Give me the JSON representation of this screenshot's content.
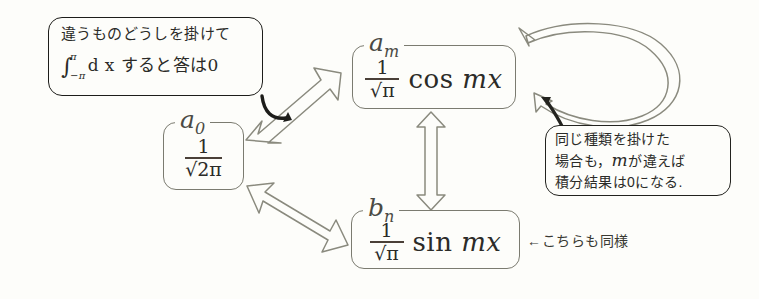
{
  "figure": {
    "background_color": "#fdfdfa",
    "line_color": "#7b7b70",
    "ink_color": "#1d1d1a"
  },
  "boxes": {
    "a0": {
      "label": "a",
      "label_sub": "0",
      "numerator": "1",
      "denominator": "√2π",
      "trig": ""
    },
    "am": {
      "label": "a",
      "label_sub": "m",
      "numerator": "1",
      "denominator": "√π",
      "trig": "cos",
      "trig_arg": "mx"
    },
    "bn": {
      "label": "b",
      "label_sub": "n",
      "numerator": "1",
      "denominator": "√π",
      "trig": "sin",
      "trig_arg": "mx"
    }
  },
  "callouts": {
    "top_left": {
      "line1": "違うものどうしを掛けて",
      "integral_symbol": "∫",
      "upper_limit": "π",
      "lower_limit": "−π",
      "line2_rest": "d x すると答は0"
    },
    "right": {
      "line1": "同じ種類を掛けた",
      "line2a": "場合も，",
      "line2_math": "m",
      "line2b": "が違えば",
      "line3": "積分結果は0になる."
    }
  },
  "annotations": {
    "bn_note": "←こちらも同様"
  },
  "arrows": {
    "a0_am": "double-headed-arrow-a0-to-am",
    "a0_bn": "double-headed-arrow-a0-to-bn",
    "am_bn": "double-headed-arrow-am-to-bn",
    "am_self": "self-loop-double-arrow-am"
  }
}
